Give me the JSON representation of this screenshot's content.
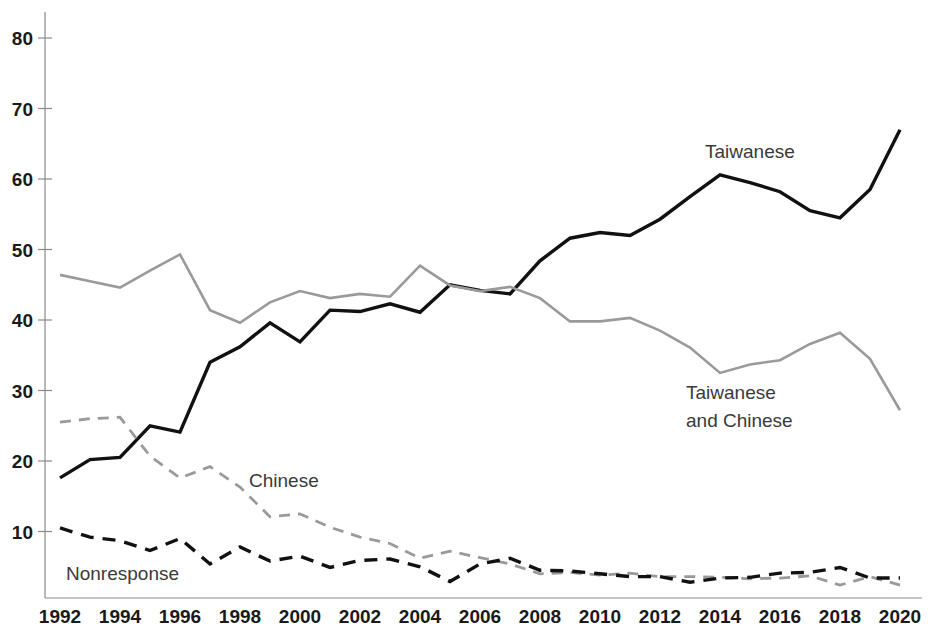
{
  "chart_data": {
    "type": "line",
    "title": "",
    "subtitle": "",
    "xlabel": "",
    "ylabel": "",
    "xlim": [
      1992,
      2020
    ],
    "ylim": [
      0,
      85
    ],
    "ytick_values": [
      10,
      20,
      30,
      40,
      50,
      60,
      70,
      80
    ],
    "ytick_labels": [
      "10",
      "20",
      "30",
      "40",
      "50",
      "60",
      "70",
      "80"
    ],
    "xtick_values": [
      1992,
      1994,
      1996,
      1998,
      2000,
      2002,
      2004,
      2006,
      2008,
      2010,
      2012,
      2014,
      2016,
      2018,
      2020
    ],
    "xtick_labels": [
      "1992",
      "1994",
      "1996",
      "1998",
      "2000",
      "2002",
      "2004",
      "2006",
      "2008",
      "2010",
      "2012",
      "2014",
      "2016",
      "2018",
      "2020"
    ],
    "grid": false,
    "legend_position": "inline-annotations",
    "x": [
      1992,
      1993,
      1994,
      1995,
      1996,
      1997,
      1998,
      1999,
      2000,
      2001,
      2002,
      2003,
      2004,
      2005,
      2006,
      2007,
      2008,
      2009,
      2010,
      2011,
      2012,
      2013,
      2014,
      2015,
      2016,
      2017,
      2018,
      2019,
      2020
    ],
    "series": [
      {
        "name": "Taiwanese",
        "style": "solid",
        "color": "#111111",
        "width": 3.4,
        "label": "Taiwanese",
        "label_x": 2012.4,
        "label_y": 62.5,
        "values": [
          17.6,
          20.2,
          20.5,
          25.0,
          24.1,
          34.0,
          36.2,
          39.6,
          36.9,
          41.4,
          41.2,
          42.3,
          41.1,
          45.0,
          44.2,
          43.7,
          48.4,
          51.6,
          52.4,
          52.0,
          54.3,
          57.5,
          60.6,
          59.5,
          58.2,
          55.5,
          54.5,
          58.5,
          67.0
        ]
      },
      {
        "name": "Taiwanese and Chinese",
        "style": "solid",
        "color": "#9a9a9a",
        "width": 2.6,
        "label": "Taiwanese\nand Chinese",
        "label_x": 2013.6,
        "label_y": 30.2,
        "values": [
          46.4,
          45.5,
          44.6,
          47.0,
          49.3,
          41.4,
          39.6,
          42.5,
          44.1,
          43.1,
          43.7,
          43.3,
          47.7,
          44.9,
          44.1,
          44.7,
          43.1,
          39.8,
          39.8,
          40.3,
          38.5,
          36.1,
          32.5,
          33.7,
          34.3,
          36.6,
          38.2,
          34.5,
          27.2
        ]
      },
      {
        "name": "Chinese",
        "style": "dashed",
        "color": "#9a9a9a",
        "width": 2.8,
        "label": "Chinese",
        "label_x": 2001.2,
        "label_y": 18.6,
        "values": [
          25.5,
          26.0,
          26.2,
          20.7,
          17.6,
          19.2,
          16.3,
          12.1,
          12.5,
          10.6,
          9.2,
          8.3,
          6.2,
          7.2,
          6.3,
          5.4,
          4.0,
          4.2,
          3.8,
          4.1,
          3.6,
          3.6,
          3.5,
          3.3,
          3.4,
          3.7,
          2.4,
          3.6,
          2.4
        ]
      },
      {
        "name": "Nonresponse",
        "style": "dashed",
        "color": "#111111",
        "width": 3.4,
        "label": "Nonresponse",
        "label_x": 1995.0,
        "label_y": 4.0,
        "values": [
          10.5,
          9.2,
          8.7,
          7.3,
          9.0,
          5.4,
          7.8,
          5.8,
          6.5,
          4.9,
          5.9,
          6.1,
          5.0,
          2.9,
          5.4,
          6.2,
          4.5,
          4.4,
          4.0,
          3.6,
          3.6,
          2.8,
          3.4,
          3.5,
          4.1,
          4.2,
          4.9,
          3.4,
          3.4
        ]
      }
    ]
  },
  "labels": {
    "taiwanese": "Taiwanese",
    "taiwanese_and_chinese_line1": "Taiwanese",
    "taiwanese_and_chinese_line2": "and Chinese",
    "chinese": "Chinese",
    "nonresponse": "Nonresponse"
  },
  "axis": {
    "y_80": "80",
    "y_70": "70",
    "y_60": "60",
    "y_50": "50",
    "y_40": "40",
    "y_30": "30",
    "y_20": "20",
    "y_10": "10",
    "x_1992": "1992",
    "x_1994": "1994",
    "x_1996": "1996",
    "x_1998": "1998",
    "x_2000": "2000",
    "x_2002": "2002",
    "x_2004": "2004",
    "x_2006": "2006",
    "x_2008": "2008",
    "x_2010": "2010",
    "x_2012": "2012",
    "x_2014": "2014",
    "x_2016": "2016",
    "x_2018": "2018",
    "x_2020": "2020"
  },
  "colors": {
    "axis": "#8a8a8a",
    "dark_series": "#111111",
    "light_series": "#9a9a9a",
    "text": "#1a1a1a",
    "annotation_text": "#3a3a3a",
    "background": "#ffffff"
  }
}
